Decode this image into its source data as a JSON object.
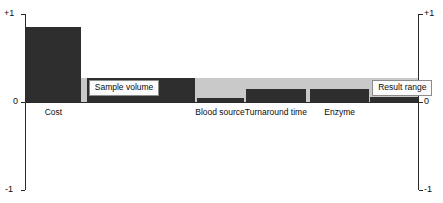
{
  "chart_data": {
    "type": "bar",
    "title": "",
    "subtitle": "",
    "xlabel": "",
    "ylabel": "",
    "ylim": [
      -1,
      1
    ],
    "grid": false,
    "legend": "none",
    "orientation": "vertical",
    "baseline": 0,
    "axis_ticks": [
      "+1",
      "0",
      "-1"
    ],
    "axis_tick_values": [
      1,
      0,
      -1
    ],
    "dual_axis": true,
    "left_axis_labels": [
      "+1",
      "0",
      "-1"
    ],
    "right_axis_labels": [
      "+1",
      "0",
      "-1"
    ],
    "band": {
      "label": "reference band",
      "color": "#c9c9c9",
      "y_low": 0.0,
      "y_high": 0.27,
      "spans_full_width": true
    },
    "bar_color": "#2e2e2e",
    "categories": [
      "Cost",
      "Sample volume",
      "Blood source",
      "Turnaround time",
      "Enzyme",
      "Result range"
    ],
    "values": [
      0.85,
      0.27,
      0.04,
      0.15,
      0.15,
      0.06
    ],
    "series": [
      {
        "name": "Sensitivity",
        "values": [
          0.85,
          0.27,
          0.04,
          0.15,
          0.15,
          0.06
        ]
      }
    ],
    "bars": [
      {
        "category": "Cost",
        "value": 0.85,
        "x_start": 0.0,
        "x_end": 0.14,
        "label_placement": "below-axis",
        "label": "Cost"
      },
      {
        "category": "Sample volume",
        "value": 0.27,
        "x_start": 0.155,
        "x_end": 0.43,
        "label_placement": "inline-box",
        "label": "Sample volume"
      },
      {
        "category": "Blood source",
        "value": 0.04,
        "x_start": 0.435,
        "x_end": 0.555,
        "label_placement": "below-axis",
        "label": "Blood source"
      },
      {
        "category": "Turnaround time",
        "value": 0.15,
        "x_start": 0.56,
        "x_end": 0.715,
        "label_placement": "below-axis",
        "label": "Turnaround time"
      },
      {
        "category": "Enzyme",
        "value": 0.15,
        "x_start": 0.725,
        "x_end": 0.875,
        "label_placement": "below-axis",
        "label": "Enzyme"
      },
      {
        "category": "Result range",
        "value": 0.06,
        "x_start": 0.878,
        "x_end": 1.0,
        "label_placement": "inline-box",
        "label": "Result range"
      }
    ],
    "inline_labels": [
      {
        "text": "Sample volume"
      },
      {
        "text": "Result range"
      }
    ],
    "below_axis_labels": [
      {
        "text": "Cost"
      },
      {
        "text": "Blood source"
      },
      {
        "text": "Turnaround time"
      },
      {
        "text": "Enzyme"
      }
    ]
  },
  "axis": {
    "top_label": "+1",
    "mid_label": "0",
    "bottom_label": "-1"
  },
  "labels": {
    "cost": "Cost",
    "sample_volume": "Sample volume",
    "blood_source": "Blood source",
    "turnaround_time": "Turnaround time",
    "enzyme": "Enzyme",
    "result_range": "Result range"
  },
  "colors": {
    "bar": "#2e2e2e",
    "band": "#c9c9c9",
    "axis": "#2b2b2b",
    "label_box_bg": "#fbfbfb",
    "label_box_border": "#8c8c8c",
    "background": "#ffffff"
  }
}
